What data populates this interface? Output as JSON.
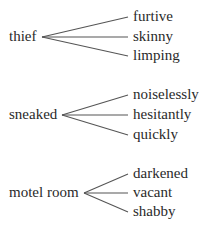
{
  "groups": [
    {
      "root": "thief",
      "branches": [
        "furtive",
        "skinny",
        "limping"
      ]
    },
    {
      "root": "sneaked",
      "branches": [
        "noiselessly",
        "hesitantly",
        "quickly"
      ]
    },
    {
      "root": "motel room",
      "branches": [
        "darkened",
        "vacant",
        "shabby"
      ]
    }
  ],
  "colors": {
    "line": "#555555",
    "text": "#2a2a2a"
  }
}
